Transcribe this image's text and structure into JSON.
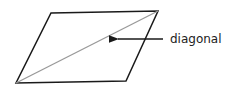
{
  "diagram": {
    "shape": "parallelogram",
    "vertices": {
      "top_left": [
        51,
        13
      ],
      "top_right": [
        158,
        11
      ],
      "bottom_right": [
        126,
        81
      ],
      "bottom_left": [
        16,
        83
      ]
    },
    "diagonal": {
      "from": "bottom_left",
      "to": "top_right",
      "color": "#999999"
    },
    "annotation": {
      "label": "diagonal",
      "arrow_from": [
        163,
        39
      ],
      "arrow_to": [
        114,
        39
      ]
    },
    "outline_color": "#1a1a1a"
  }
}
